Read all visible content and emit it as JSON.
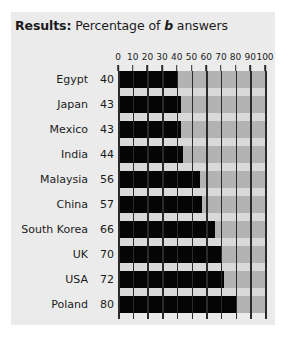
{
  "clipped_top_text": "",
  "title": {
    "lead": "Results:",
    "rest_before_italic": " Percentage of ",
    "italic": "b",
    "rest_after_italic": " answers"
  },
  "chart_data": {
    "type": "bar",
    "orientation": "horizontal",
    "title": "Results: Percentage of b answers",
    "xlabel": "",
    "ylabel": "",
    "xlim": [
      0,
      100
    ],
    "xticks": [
      0,
      10,
      20,
      30,
      40,
      50,
      60,
      70,
      80,
      90,
      100
    ],
    "xtick_labels": [
      "0",
      "10",
      "20",
      "30",
      "40",
      "50",
      "60",
      "70",
      "80",
      "90",
      "100"
    ],
    "grid": true,
    "legend": false,
    "categories": [
      "Egypt",
      "Japan",
      "Mexico",
      "India",
      "Malaysia",
      "China",
      "South Korea",
      "UK",
      "USA",
      "Poland"
    ],
    "values": [
      40,
      43,
      43,
      44,
      56,
      57,
      66,
      70,
      72,
      80
    ],
    "value_labels": [
      "40",
      "43",
      "43",
      "44",
      "56",
      "57",
      "66",
      "70",
      "72",
      "80"
    ],
    "colors": {
      "bar_fill": "#050505",
      "bar_track": "#b3b3b3",
      "gap_row": "#d9d9d9",
      "gridline": "#2b2b2b",
      "panel_background": "#ebebeb",
      "page_background": "#ffffff",
      "text": "#1b1b1b"
    }
  }
}
